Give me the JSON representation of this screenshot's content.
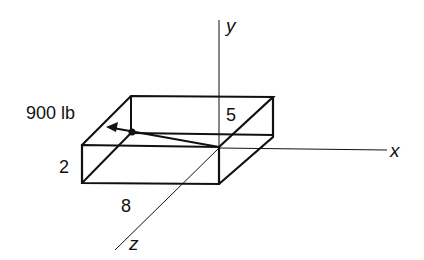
{
  "diagram": {
    "force_label": "900 lb",
    "dimensions": {
      "height": "2",
      "length": "8",
      "depth": "5"
    },
    "axes": {
      "x": "x",
      "y": "y",
      "z": "z"
    }
  }
}
